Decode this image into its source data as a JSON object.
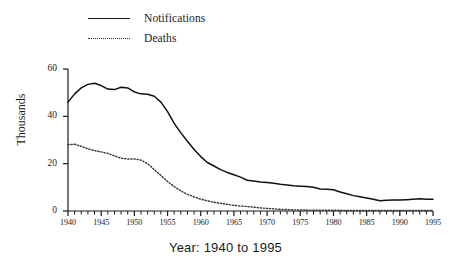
{
  "legend": {
    "items": [
      {
        "label": "Notifications",
        "style": "solid",
        "color": "#111111"
      },
      {
        "label": "Deaths",
        "style": "dotted",
        "color": "#333333"
      }
    ]
  },
  "axes": {
    "ylabel": "Thousands",
    "xlabel": "Year: 1940 to 1995",
    "ytick_labels": [
      "60",
      "40",
      "20",
      "0"
    ],
    "xtick_labels": [
      "1940",
      "1945",
      "1950",
      "1955",
      "1960",
      "1965",
      "1970",
      "1975",
      "1980",
      "1985",
      "1990",
      "1995"
    ]
  },
  "chart_data": {
    "type": "line",
    "title": "",
    "xlabel": "Year: 1940 to 1995",
    "ylabel": "Thousands",
    "xlim": [
      1940,
      1995
    ],
    "ylim": [
      0,
      60
    ],
    "yticks": [
      0,
      20,
      40,
      60
    ],
    "xticks": [
      1940,
      1945,
      1950,
      1955,
      1960,
      1965,
      1970,
      1975,
      1980,
      1985,
      1990,
      1995
    ],
    "minor_xticks_interval": 1,
    "grid": false,
    "legend_position": "top-left",
    "x": [
      1940,
      1941,
      1942,
      1943,
      1944,
      1945,
      1946,
      1947,
      1948,
      1949,
      1950,
      1951,
      1952,
      1953,
      1954,
      1955,
      1956,
      1957,
      1958,
      1959,
      1960,
      1961,
      1962,
      1963,
      1964,
      1965,
      1966,
      1967,
      1968,
      1969,
      1970,
      1971,
      1972,
      1973,
      1974,
      1975,
      1976,
      1977,
      1978,
      1979,
      1980,
      1981,
      1982,
      1983,
      1984,
      1985,
      1986,
      1987,
      1988,
      1989,
      1990,
      1991,
      1992,
      1993,
      1994,
      1995
    ],
    "series": [
      {
        "name": "Notifications",
        "style": "solid",
        "color": "#111111",
        "values": [
          46.0,
          49.5,
          52.0,
          53.5,
          54.0,
          53.0,
          51.5,
          51.3,
          52.3,
          52.0,
          50.3,
          49.5,
          49.3,
          48.5,
          46.0,
          42.0,
          37.0,
          33.0,
          29.5,
          26.0,
          23.0,
          20.5,
          19.0,
          17.5,
          16.3,
          15.3,
          14.3,
          13.0,
          12.7,
          12.3,
          12.0,
          11.7,
          11.3,
          11.0,
          10.7,
          10.5,
          10.3,
          10.0,
          9.3,
          9.2,
          9.0,
          8.0,
          7.3,
          6.5,
          6.0,
          5.5,
          5.0,
          4.3,
          4.5,
          4.6,
          4.6,
          4.8,
          5.0,
          5.2,
          5.0,
          5.0
        ]
      },
      {
        "name": "Deaths",
        "style": "dotted",
        "color": "#333333",
        "values": [
          28.0,
          28.2,
          27.3,
          26.3,
          25.5,
          25.0,
          24.3,
          23.3,
          22.3,
          22.0,
          22.0,
          21.5,
          20.0,
          17.5,
          15.0,
          12.5,
          10.3,
          8.5,
          7.0,
          6.0,
          5.0,
          4.3,
          3.7,
          3.2,
          2.8,
          2.4,
          2.1,
          1.9,
          1.6,
          1.3,
          1.1,
          0.9,
          0.7,
          0.6,
          0.5,
          0.4,
          0.4,
          0.3,
          0.3,
          0.3,
          0.3,
          0.3,
          0.2,
          0.2,
          0.2,
          0.2,
          0.2,
          0.2,
          0.2,
          0.2,
          0.2,
          0.2,
          0.2,
          0.2,
          0.2,
          0.2
        ]
      }
    ]
  }
}
